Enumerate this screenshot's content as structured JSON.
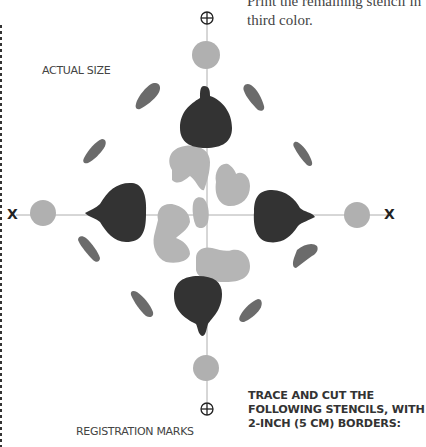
{
  "page": {
    "intro_text_line1": "Print the remaining stencil in",
    "intro_text_line2": "third color.",
    "actual_size_label": "ACTUAL SIZE",
    "registration_label": "REGISTRATION MARKS",
    "x_left": "X",
    "x_right": "X",
    "instructions_line1": "TRACE AND CUT THE",
    "instructions_line2": "FOLLOWING STENCILS, WITH",
    "instructions_line3": "2-INCH (5 CM) BORDERS:"
  },
  "colors": {
    "dark_stencil": "#333333",
    "medium_stencil": "#6b6b6b",
    "light_stencil": "#b5b5b5",
    "guide_line": "#999999"
  },
  "figure": {
    "type": "stencil-pattern",
    "registration_marks": [
      "top-crosshair",
      "bottom-crosshair"
    ],
    "center": [
      207,
      215
    ]
  }
}
